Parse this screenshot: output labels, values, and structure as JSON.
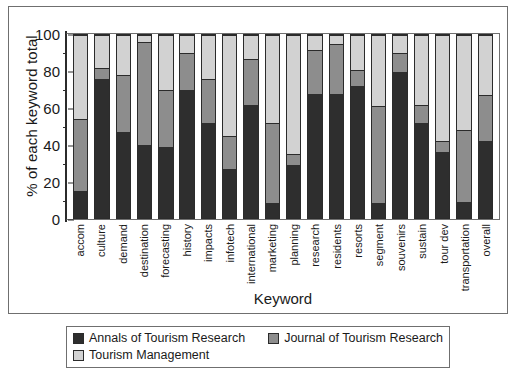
{
  "chart_data": {
    "type": "bar",
    "stacked": true,
    "title": "",
    "xlabel": "Keyword",
    "ylabel": "% of each keyword total",
    "ylim": [
      0,
      100
    ],
    "yticks": [
      0,
      20,
      40,
      60,
      80,
      100
    ],
    "yminorticks": [
      10,
      30,
      50,
      70,
      90
    ],
    "grid": false,
    "legend_position": "bottom",
    "categories": [
      "accom",
      "culture",
      "demand",
      "destination",
      "forecasting",
      "history",
      "impacts",
      "infotech",
      "international",
      "marketing",
      "planning",
      "research",
      "residents",
      "resorts",
      "segment",
      "souvenirs",
      "sustain",
      "tour dev",
      "transportation",
      "overall"
    ],
    "series": [
      {
        "name": "Annals of Tourism Research",
        "color": "#2e2e2e",
        "values": [
          15,
          76,
          47,
          40,
          39,
          70,
          52,
          27,
          62,
          8,
          29,
          68,
          68,
          72,
          8,
          80,
          52,
          36,
          9,
          42
        ]
      },
      {
        "name": "Journal of Tourism Research",
        "color": "#8d8d8d",
        "values": [
          39,
          6,
          31,
          56,
          31,
          20,
          24,
          18,
          25,
          44,
          6,
          24,
          27,
          9,
          53,
          10,
          10,
          6,
          39,
          25
        ]
      },
      {
        "name": "Tourism Management",
        "color": "#d2d2d2",
        "values": [
          46,
          18,
          22,
          4,
          30,
          10,
          24,
          55,
          13,
          48,
          65,
          8,
          5,
          19,
          39,
          10,
          38,
          58,
          52,
          33
        ]
      }
    ],
    "cumulative_tops": [
      [
        15,
        54,
        100
      ],
      [
        76,
        82,
        100
      ],
      [
        47,
        78,
        100
      ],
      [
        40,
        96,
        100
      ],
      [
        39,
        70,
        100
      ],
      [
        70,
        90,
        100
      ],
      [
        52,
        76,
        100
      ],
      [
        27,
        45,
        100
      ],
      [
        62,
        87,
        100
      ],
      [
        8,
        52,
        100
      ],
      [
        29,
        35,
        100
      ],
      [
        68,
        92,
        100
      ],
      [
        68,
        95,
        100
      ],
      [
        72,
        81,
        100
      ],
      [
        8,
        61,
        100
      ],
      [
        80,
        90,
        100
      ],
      [
        52,
        62,
        100
      ],
      [
        36,
        42,
        100
      ],
      [
        9,
        48,
        100
      ],
      [
        42,
        67,
        100
      ]
    ]
  },
  "legend": {
    "items": [
      {
        "label": "Annals of Tourism Research",
        "swatch": "s0"
      },
      {
        "label": "Journal of Tourism Research",
        "swatch": "s1"
      },
      {
        "label": "Tourism Management",
        "swatch": "s2"
      }
    ]
  }
}
